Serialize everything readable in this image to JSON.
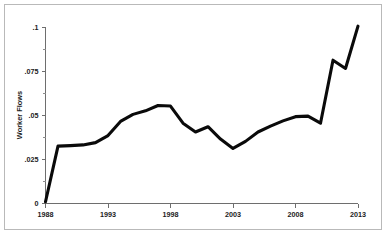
{
  "figure": {
    "background_color": "#ffffff",
    "frame_color": "#b9b9b9",
    "line_color": "#0a0a0a",
    "axis_color": "#6e6e6e"
  },
  "axes": {
    "y_title": "Worker Flows",
    "y_tick_labels": [
      "0",
      ".025",
      ".05",
      ".075",
      ".1"
    ],
    "x_tick_labels": [
      "1988",
      "1993",
      "1998",
      "2003",
      "2008",
      "2013"
    ]
  },
  "chart_data": {
    "type": "line",
    "title": "",
    "subtitle": "",
    "xlabel": "",
    "ylabel": "Worker Flows",
    "xlim": [
      1988,
      2013
    ],
    "ylim": [
      0,
      0.1
    ],
    "grid": false,
    "legend": null,
    "x_ticks": [
      1988,
      1993,
      1998,
      2003,
      2008,
      2013
    ],
    "x_tick_labels": [
      "1988",
      "1993",
      "1998",
      "2003",
      "2008",
      "2013"
    ],
    "y_ticks": [
      0,
      0.025,
      0.05,
      0.075,
      0.1
    ],
    "y_tick_labels": [
      "0",
      ".025",
      ".05",
      ".075",
      ".1"
    ],
    "y_minor_ticks": [
      0.0125,
      0.0375,
      0.0625,
      0.0875
    ],
    "x": [
      1988,
      1989,
      1990,
      1991,
      1992,
      1993,
      1994,
      1995,
      1996,
      1997,
      1998,
      1999,
      2000,
      2001,
      2002,
      2003,
      2004,
      2005,
      2006,
      2007,
      2008,
      2009,
      2010,
      2011,
      2012,
      2013
    ],
    "series": [
      {
        "name": "Worker Flows",
        "color": "#0a0a0a",
        "values": [
          0.001,
          0.0325,
          0.0328,
          0.0332,
          0.0345,
          0.0385,
          0.0465,
          0.0505,
          0.0525,
          0.0555,
          0.0552,
          0.0455,
          0.0405,
          0.0435,
          0.0365,
          0.0312,
          0.0352,
          0.0405,
          0.0438,
          0.0468,
          0.0492,
          0.0495,
          0.0455,
          0.0812,
          0.0765,
          0.1005
        ]
      }
    ],
    "annotations": []
  }
}
